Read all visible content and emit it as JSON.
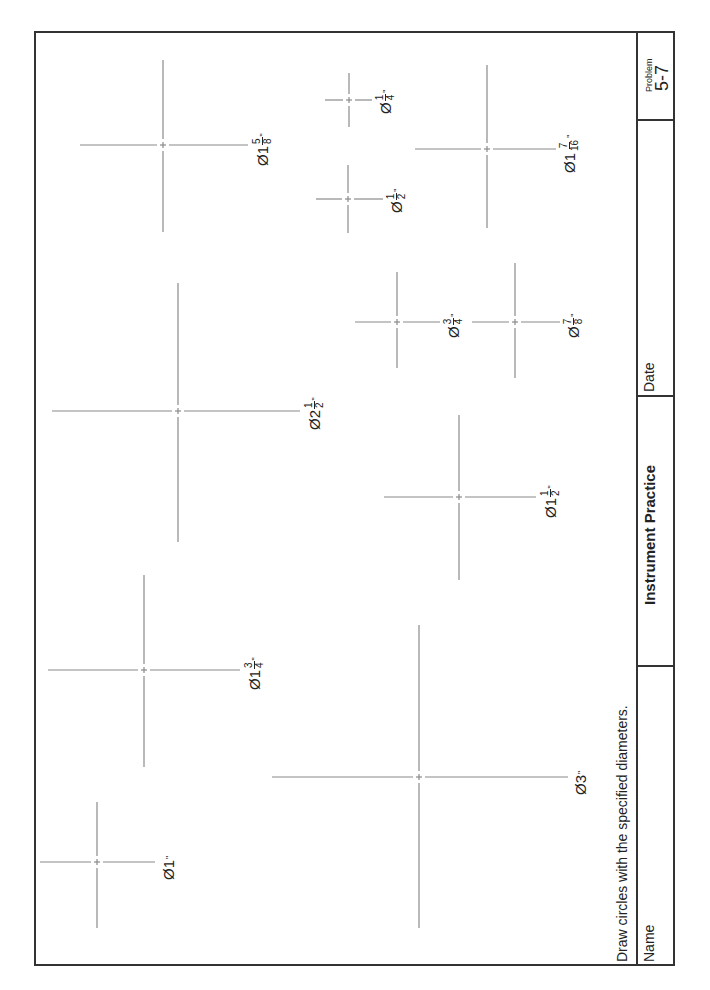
{
  "title_block": {
    "problem_label": "Problem",
    "problem_number": "5-7",
    "date_label": "Date",
    "title": "Instrument Practice",
    "name_label": "Name"
  },
  "instruction": "Draw circles with the specified diameters.",
  "colors": {
    "border": "#333333",
    "centerline": "#8a8a8a",
    "text": "#222222"
  },
  "centers": [
    {
      "id": "d1",
      "label_prefix": "Ø1",
      "num": "",
      "den": "",
      "inch": "\"",
      "cx": 97,
      "cy": 862,
      "x1": 40,
      "x2": 155,
      "y1": 802,
      "y2": 928,
      "lx": 160,
      "ly": 880
    },
    {
      "id": "d3",
      "label_prefix": "Ø3",
      "num": "",
      "den": "",
      "inch": "\"",
      "cx": 419,
      "cy": 777,
      "x1": 272,
      "x2": 568,
      "y1": 625,
      "y2": 928,
      "lx": 572,
      "ly": 795
    },
    {
      "id": "d1-3-4",
      "label_prefix": "Ø1",
      "num": "3",
      "den": "4",
      "inch": "\"",
      "cx": 144,
      "cy": 670,
      "x1": 48,
      "x2": 240,
      "y1": 575,
      "y2": 767,
      "lx": 244,
      "ly": 690
    },
    {
      "id": "d1-1-2",
      "label_prefix": "Ø1",
      "num": "1",
      "den": "2",
      "inch": "\"",
      "cx": 459,
      "cy": 497,
      "x1": 384,
      "x2": 536,
      "y1": 415,
      "y2": 580,
      "lx": 540,
      "ly": 518
    },
    {
      "id": "d2-1-2",
      "label_prefix": "Ø2",
      "num": "1",
      "den": "2",
      "inch": "\"",
      "cx": 178,
      "cy": 411,
      "x1": 52,
      "x2": 300,
      "y1": 283,
      "y2": 542,
      "lx": 304,
      "ly": 430
    },
    {
      "id": "d3-4",
      "label_prefix": "Ø",
      "num": "3",
      "den": "4",
      "inch": "\"",
      "cx": 397,
      "cy": 322,
      "x1": 355,
      "x2": 440,
      "y1": 272,
      "y2": 368,
      "lx": 443,
      "ly": 338
    },
    {
      "id": "d7-8",
      "label_prefix": "Ø",
      "num": "7",
      "den": "8",
      "inch": "\"",
      "cx": 515,
      "cy": 322,
      "x1": 472,
      "x2": 560,
      "y1": 263,
      "y2": 378,
      "lx": 563,
      "ly": 338
    },
    {
      "id": "d1-5-8",
      "label_prefix": "Ø1",
      "num": "5",
      "den": "8",
      "inch": "\"",
      "cx": 163,
      "cy": 145,
      "x1": 80,
      "x2": 248,
      "y1": 60,
      "y2": 232,
      "lx": 252,
      "ly": 166
    },
    {
      "id": "d1-2",
      "label_prefix": "Ø",
      "num": "1",
      "den": "2",
      "inch": "\"",
      "cx": 348,
      "cy": 199,
      "x1": 316,
      "x2": 383,
      "y1": 165,
      "y2": 233,
      "lx": 386,
      "ly": 213
    },
    {
      "id": "d1-4",
      "label_prefix": "Ø",
      "num": "1",
      "den": "4",
      "inch": "\"",
      "cx": 349,
      "cy": 100,
      "x1": 325,
      "x2": 372,
      "y1": 73,
      "y2": 127,
      "lx": 375,
      "ly": 114
    },
    {
      "id": "d1-7-16",
      "label_prefix": "Ø1",
      "num": "7",
      "den": "16",
      "inch": "\"",
      "cx": 487,
      "cy": 149,
      "x1": 415,
      "x2": 556,
      "y1": 65,
      "y2": 228,
      "lx": 559,
      "ly": 173
    }
  ]
}
